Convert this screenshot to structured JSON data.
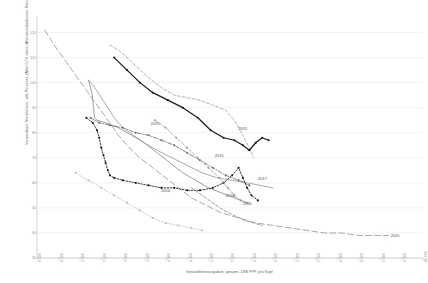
{
  "chart_data": {
    "type": "line",
    "title": "",
    "xlabel": "Gesundheitsausgaben, gesamt, US$ PPP, pro Kopf",
    "ylabel": "Vermeidbare Sterblichkeit, alle Personen (Alter 0-74 Jahre) Altersstandardisierte Raten je 100.000",
    "xlim": [
      1000,
      10000
    ],
    "ylim": [
      30,
      125
    ],
    "grid": true,
    "legend": "none",
    "xticks": [
      "1 000",
      "1 500",
      "2 000",
      "2 500",
      "3 000",
      "3 500",
      "4 000",
      "4 500",
      "5 000",
      "5 500",
      "6 000",
      "6 500",
      "7 000",
      "7 500",
      "8 000",
      "8 500",
      "9 000",
      "9 500",
      "10 000"
    ],
    "yticks": [
      "120",
      "110",
      "100",
      "90",
      "80",
      "70",
      "60",
      "50",
      "40",
      "30"
    ],
    "annotations": [
      {
        "text": "2015",
        "x": 3750,
        "y": 84
      },
      {
        "text": "2015",
        "x": 5800,
        "y": 82
      },
      {
        "text": "2015",
        "x": 5250,
        "y": 71
      },
      {
        "text": "2016",
        "x": 4000,
        "y": 57
      },
      {
        "text": "2016",
        "x": 5500,
        "y": 55
      },
      {
        "text": "2016",
        "x": 5900,
        "y": 52
      },
      {
        "text": "2017",
        "x": 6250,
        "y": 62
      },
      {
        "text": "2015",
        "x": 9350,
        "y": 39
      }
    ],
    "series": [
      {
        "name": "series-longdash-gray",
        "style": "long-dash",
        "color": "#9a9a9e",
        "markers": false,
        "points": [
          [
            1180,
            121
          ],
          [
            1400,
            115
          ],
          [
            1650,
            109
          ],
          [
            1900,
            103
          ],
          [
            2150,
            97
          ],
          [
            2400,
            91
          ],
          [
            2650,
            85
          ],
          [
            2900,
            79
          ],
          [
            3150,
            74
          ],
          [
            3400,
            70
          ],
          [
            3700,
            66
          ],
          [
            4000,
            62
          ],
          [
            4300,
            58
          ],
          [
            4600,
            54
          ],
          [
            4950,
            51
          ],
          [
            5300,
            48
          ],
          [
            5700,
            46
          ],
          [
            6100,
            44
          ],
          [
            6500,
            43
          ],
          [
            6900,
            42
          ],
          [
            7300,
            41
          ],
          [
            7700,
            40
          ],
          [
            8100,
            40
          ],
          [
            8500,
            39
          ],
          [
            8900,
            39
          ],
          [
            9200,
            39
          ]
        ]
      },
      {
        "name": "series-dash-gray-upper",
        "style": "dash",
        "color": "#a5a5a9",
        "markers": false,
        "points": [
          [
            2700,
            115
          ],
          [
            2900,
            113
          ],
          [
            3100,
            110
          ],
          [
            3350,
            106
          ],
          [
            3600,
            102
          ],
          [
            3900,
            98
          ],
          [
            4200,
            95
          ],
          [
            4500,
            94
          ],
          [
            4800,
            93
          ],
          [
            5100,
            91
          ],
          [
            5400,
            89
          ],
          [
            5600,
            85
          ],
          [
            5800,
            79
          ],
          [
            5950,
            74
          ],
          [
            6050,
            70
          ]
        ]
      },
      {
        "name": "series-solid-black",
        "style": "solid",
        "color": "#1b1b1b",
        "markers": true,
        "points": [
          [
            2800,
            110
          ],
          [
            3100,
            105
          ],
          [
            3400,
            100
          ],
          [
            3700,
            96
          ],
          [
            4050,
            93
          ],
          [
            4400,
            90
          ],
          [
            4750,
            86
          ],
          [
            5050,
            81
          ],
          [
            5350,
            78
          ],
          [
            5600,
            77
          ],
          [
            5800,
            75
          ],
          [
            5950,
            73
          ],
          [
            6100,
            76
          ],
          [
            6250,
            78
          ],
          [
            6400,
            77
          ]
        ]
      },
      {
        "name": "series-solid-gray-mid",
        "style": "solid",
        "color": "#9c9c9f",
        "markers": false,
        "points": [
          [
            2200,
            101
          ],
          [
            2350,
            98
          ],
          [
            2500,
            94
          ],
          [
            2650,
            90
          ],
          [
            2800,
            86
          ],
          [
            3000,
            82
          ],
          [
            3250,
            79
          ],
          [
            3500,
            76
          ],
          [
            3800,
            73
          ],
          [
            4150,
            70
          ],
          [
            4500,
            67
          ],
          [
            4850,
            64
          ],
          [
            5200,
            62
          ],
          [
            5550,
            61
          ],
          [
            5900,
            60
          ],
          [
            6200,
            59
          ],
          [
            6500,
            58
          ]
        ]
      },
      {
        "name": "series-solid-gray-steep",
        "style": "solid",
        "color": "#8f8f93",
        "markers": false,
        "points": [
          [
            2200,
            101
          ],
          [
            2280,
            96
          ],
          [
            2320,
            90
          ],
          [
            2340,
            86
          ],
          [
            2400,
            85
          ],
          [
            2600,
            84
          ],
          [
            2900,
            82
          ],
          [
            3200,
            79
          ],
          [
            3500,
            76
          ],
          [
            3800,
            72
          ],
          [
            4100,
            68
          ],
          [
            4400,
            64
          ],
          [
            4700,
            61
          ],
          [
            5000,
            58
          ],
          [
            5300,
            56
          ],
          [
            5600,
            54
          ],
          [
            5900,
            52
          ]
        ]
      },
      {
        "name": "series-dashdot-gray",
        "style": "dash-dot",
        "color": "#6d6d70",
        "markers": true,
        "points": [
          [
            2250,
            86
          ],
          [
            2450,
            84
          ],
          [
            2700,
            83
          ],
          [
            3000,
            82
          ],
          [
            3300,
            80
          ],
          [
            3600,
            79
          ],
          [
            3900,
            77
          ],
          [
            4200,
            75
          ],
          [
            4500,
            72
          ],
          [
            4800,
            69
          ],
          [
            5100,
            66
          ],
          [
            5400,
            63
          ],
          [
            5700,
            61
          ],
          [
            5950,
            59
          ]
        ]
      },
      {
        "name": "series-dot-dense-black",
        "style": "dot-dense",
        "color": "#1b1b1b",
        "markers": true,
        "points": [
          [
            2150,
            86
          ],
          [
            2300,
            84
          ],
          [
            2400,
            81
          ],
          [
            2450,
            78
          ],
          [
            2500,
            74
          ],
          [
            2550,
            71
          ],
          [
            2600,
            68
          ],
          [
            2650,
            65
          ],
          [
            2700,
            63
          ],
          [
            2800,
            62
          ],
          [
            3000,
            61
          ],
          [
            3300,
            60
          ],
          [
            3600,
            59
          ],
          [
            3900,
            58
          ],
          [
            4200,
            58
          ],
          [
            4500,
            57
          ],
          [
            4800,
            57
          ],
          [
            5100,
            58
          ],
          [
            5350,
            60
          ],
          [
            5550,
            63
          ],
          [
            5700,
            66
          ],
          [
            5800,
            62
          ],
          [
            5900,
            58
          ],
          [
            6000,
            55
          ],
          [
            6150,
            53
          ]
        ]
      },
      {
        "name": "series-dash-gray-low",
        "style": "dash",
        "color": "#9e9ea2",
        "markers": true,
        "points": [
          [
            3750,
            85
          ],
          [
            4000,
            82
          ],
          [
            4250,
            78
          ],
          [
            4500,
            74
          ],
          [
            4750,
            70
          ],
          [
            5000,
            66
          ],
          [
            5250,
            62
          ],
          [
            5450,
            58
          ],
          [
            5600,
            55
          ],
          [
            5750,
            53
          ],
          [
            5900,
            52
          ]
        ]
      },
      {
        "name": "series-dotted-light-low",
        "style": "dot",
        "color": "#bcbcc0",
        "markers": true,
        "points": [
          [
            1900,
            64
          ],
          [
            2200,
            61
          ],
          [
            2500,
            58
          ],
          [
            2800,
            55
          ],
          [
            3100,
            52
          ],
          [
            3400,
            49
          ],
          [
            3700,
            46
          ],
          [
            4000,
            44
          ],
          [
            4300,
            43
          ],
          [
            4600,
            42
          ],
          [
            4850,
            41
          ]
        ]
      },
      {
        "name": "series-dash-gray-descend",
        "style": "dash",
        "color": "#8b8b8f",
        "markers": false,
        "points": [
          [
            4600,
            58
          ],
          [
            4850,
            55
          ],
          [
            5100,
            52
          ],
          [
            5350,
            49
          ],
          [
            5600,
            47
          ],
          [
            5850,
            45
          ],
          [
            6050,
            44
          ],
          [
            6250,
            43
          ]
        ]
      }
    ]
  }
}
